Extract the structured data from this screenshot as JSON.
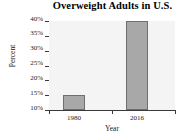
{
  "chart_data": {
    "type": "bar",
    "title": "Overweight Adults in U.S.",
    "xlabel": "Year",
    "ylabel": "Percent",
    "categories": [
      "1980",
      "2016"
    ],
    "values": [
      15,
      40
    ],
    "value_labels": [
      "15%",
      "40%"
    ],
    "ylim": [
      10,
      40
    ],
    "yticks": [
      10,
      15,
      20,
      25,
      30,
      35,
      40
    ],
    "ytick_labels": [
      "10%",
      "15%",
      "20%",
      "25%",
      "30%",
      "35%",
      "40%"
    ],
    "grid": false,
    "legend": null,
    "series": [
      {
        "name": "Percent of overweight adults",
        "values": [
          15,
          40
        ]
      }
    ],
    "bar_color": "#a8a8a8",
    "bar_edge_color": "#6e6e6e",
    "plot_background": "#f4f4f4",
    "axis_color": "#3a3a3a"
  }
}
